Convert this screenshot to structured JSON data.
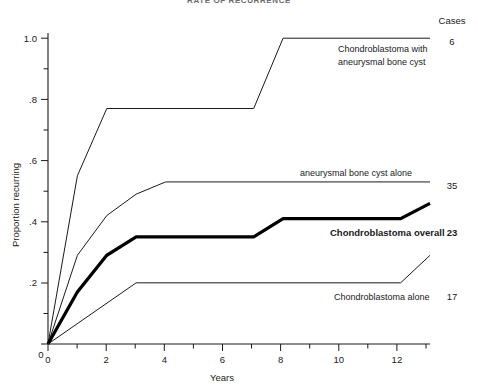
{
  "figure": {
    "title": "RATE OF RECURRENCE",
    "cases_header": "Cases"
  },
  "chart_data": {
    "type": "line",
    "title": "RATE OF RECURRENCE",
    "xlabel": "Years",
    "ylabel": "Proportion recurring",
    "xlim": [
      0,
      13
    ],
    "ylim": [
      0,
      1.05
    ],
    "grid": false,
    "legend": "inline-right-annotations",
    "xticks": [
      0,
      1,
      2,
      3,
      4,
      5,
      6,
      7,
      8,
      9,
      10,
      11,
      12,
      13
    ],
    "xtick_labels": [
      "0",
      "",
      "2",
      "",
      "4",
      "",
      "6",
      "",
      "8",
      "",
      "10",
      "",
      "12",
      ""
    ],
    "yticks": [
      0,
      0.1,
      0.2,
      0.3,
      0.4,
      0.5,
      0.6,
      0.7,
      0.8,
      0.9,
      1.0
    ],
    "ytick_labels": [
      "0",
      "",
      ".2",
      "",
      ".4",
      "",
      ".6",
      "",
      ".8",
      "",
      "1.0"
    ],
    "series": [
      {
        "name": "Chondroblastoma with aneurysmal bone cyst",
        "label_lines": [
          "Chondroblastoma with",
          "aneurysmal bone cyst"
        ],
        "cases": "6",
        "emphasis": "normal",
        "x": [
          0,
          1,
          2,
          7,
          8,
          13
        ],
        "y": [
          0,
          0.55,
          0.77,
          0.77,
          1.0,
          1.0
        ]
      },
      {
        "name": "aneurysmal bone cyst alone",
        "label_lines": [
          "aneurysmal bone cyst alone"
        ],
        "cases": "35",
        "emphasis": "normal",
        "x": [
          0,
          1,
          2,
          3,
          4,
          13
        ],
        "y": [
          0,
          0.29,
          0.42,
          0.49,
          0.53,
          0.53
        ]
      },
      {
        "name": "Chondroblastoma overall",
        "label_lines": [
          "Chondroblastoma overall"
        ],
        "cases": "23",
        "emphasis": "bold",
        "x": [
          0,
          1,
          2,
          3,
          7,
          8,
          12,
          13
        ],
        "y": [
          0,
          0.17,
          0.29,
          0.35,
          0.35,
          0.41,
          0.41,
          0.46
        ]
      },
      {
        "name": "Chondroblastoma alone",
        "label_lines": [
          "Chondroblastoma alone"
        ],
        "cases": "17",
        "emphasis": "normal",
        "x": [
          0,
          3,
          12,
          13
        ],
        "y": [
          0,
          0.2,
          0.2,
          0.29
        ]
      }
    ]
  },
  "axes": {
    "y_title": "Proportion recurring",
    "x_title": "Years",
    "x_tick_texts": [
      "0",
      "2",
      "4",
      "6",
      "8",
      "10",
      "12"
    ],
    "y_tick_texts": [
      "1.0",
      ".8",
      ".6",
      ".4",
      ".2",
      "0"
    ]
  },
  "annotations": {
    "series1_line1": "Chondroblastoma with",
    "series1_line2": "aneurysmal bone cyst",
    "series1_cases": "6",
    "series2_line1": "aneurysmal bone cyst alone",
    "series2_cases": "35",
    "series3_line1": "Chondroblastoma overall",
    "series3_cases": "23",
    "series4_line1": "Chondroblastoma alone",
    "series4_cases": "17"
  }
}
